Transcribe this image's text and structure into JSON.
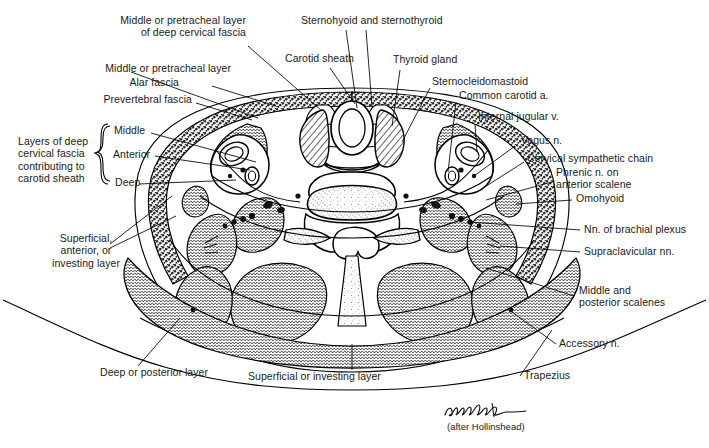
{
  "figure": {
    "kind": "anatomical-cross-section",
    "signature": "Archambault",
    "credit": "(after Hollinshead)",
    "ink_color": "#000000",
    "paper_color": "#ffffff"
  },
  "labels": {
    "middle_pretracheal_deep": "Middle or pretracheal layer\nof deep cervical fascia",
    "middle_pretracheal": "Middle or pretracheal layer",
    "alar_fascia": "Alar fascia",
    "prevertebral_fascia": "Prevertebral fascia",
    "sternohyoid_sternothyroid": "Sternohyoid and sternothyroid",
    "carotid_sheath": "Carotid sheath",
    "thyroid_gland": "Thyroid gland",
    "sternocleidomastoid": "Sternocleidomastoid",
    "common_carotid": "Common carotid a.",
    "internal_jugular": "Internal jugular v.",
    "vagus": "Vagus n.",
    "cervical_sympathetic_chain": "Cervical sympathetic chain",
    "phrenic": "Phrenic n. on\nanterior scalene",
    "omohyoid": "Omohyoid",
    "brachial_plexus": "Nn. of brachial plexus",
    "supraclavicular": "Supraclavicular nn.",
    "middle_posterior_scalenes": "Middle and\nposterior scalenes",
    "accessory": "Accessory n.",
    "trapezius": "Trapezius",
    "layers_group": "Layers of deep\ncervical fascia\ncontributing to\ncarotid sheath",
    "layer_middle": "Middle",
    "layer_anterior": "Anterior",
    "layer_deep": "Deep",
    "superficial_anterior_investing": "Superficial,\nanterior, or\ninvesting layer",
    "deep_or_posterior_layer": "Deep or posterior layer",
    "superficial_or_investing_layer": "Superficial or investing layer"
  },
  "label_positions": {
    "middle_pretracheal_deep": {
      "x": 143,
      "y": 20,
      "align": "right"
    },
    "middle_pretracheal": {
      "x": 128,
      "y": 68,
      "align": "right"
    },
    "alar_fascia": {
      "x": 172,
      "y": 82,
      "align": "right"
    },
    "prevertebral_fascia": {
      "x": 114,
      "y": 99,
      "align": "right"
    },
    "sternohyoid_sternothyroid": {
      "x": 301,
      "y": 19,
      "align": "left"
    },
    "carotid_sheath": {
      "x": 285,
      "y": 56,
      "align": "left"
    },
    "thyroid_gland": {
      "x": 393,
      "y": 58,
      "align": "left"
    },
    "sternocleidomastoid": {
      "x": 432,
      "y": 80,
      "align": "left"
    },
    "common_carotid": {
      "x": 459,
      "y": 94,
      "align": "left"
    },
    "internal_jugular": {
      "x": 478,
      "y": 114,
      "align": "left"
    },
    "vayus": {
      "x": 518,
      "y": 139,
      "align": "left"
    },
    "cervical_sympathetic_chain": {
      "x": 527,
      "y": 157,
      "align": "left"
    },
    "phrenic": {
      "x": 556,
      "y": 170,
      "align": "left"
    },
    "omohyoid": {
      "x": 576,
      "y": 196,
      "align": "left"
    },
    "brachial_plexus": {
      "x": 584,
      "y": 224,
      "align": "left"
    },
    "supraclavicular": {
      "x": 584,
      "y": 247,
      "align": "left"
    },
    "middle_posterior_scalenes": {
      "x": 579,
      "y": 288,
      "align": "left"
    },
    "accessory": {
      "x": 559,
      "y": 339,
      "align": "left"
    },
    "trapezius": {
      "x": 524,
      "y": 371,
      "align": "left"
    },
    "layers_group": {
      "x": 18,
      "y": 141,
      "align": "left"
    },
    "layer_middle": {
      "x": 114,
      "y": 129,
      "align": "left"
    },
    "layer_anterior": {
      "x": 113,
      "y": 152,
      "align": "left"
    },
    "layer_deep": {
      "x": 115,
      "y": 180,
      "align": "left"
    },
    "superficial_anterior_investing": {
      "x": 35,
      "y": 236,
      "align": "left"
    },
    "deep_or_posterior_layer": {
      "x": 100,
      "y": 369,
      "align": "left"
    },
    "superficial_or_investing_layer": {
      "x": 248,
      "y": 373,
      "align": "left"
    }
  }
}
